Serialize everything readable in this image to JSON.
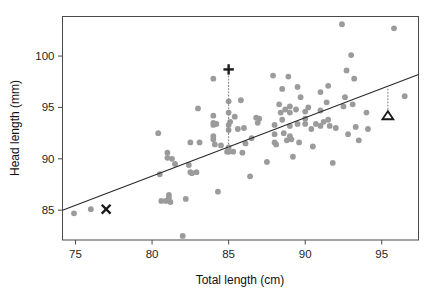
{
  "chart_data": {
    "type": "scatter",
    "title": "",
    "xlabel": "Total length (cm)",
    "ylabel": "Head length (mm)",
    "xlim": [
      74.15,
      97.4
    ],
    "ylim": [
      82.1,
      103.85
    ],
    "xticks": [
      75,
      80,
      85,
      90,
      95
    ],
    "yticks": [
      85,
      90,
      95,
      100
    ],
    "xtick_labels": [
      "75",
      "80",
      "85",
      "90",
      "95"
    ],
    "ytick_labels": [
      "85",
      "90",
      "95",
      "100"
    ],
    "grid": false,
    "legend": "none",
    "series": [
      {
        "name": "possum observations",
        "marker": "circle",
        "color": "#9b9b9b",
        "points": [
          [
            74.9,
            84.7
          ],
          [
            76.0,
            85.1
          ],
          [
            80.4,
            92.5
          ],
          [
            80.5,
            88.5
          ],
          [
            80.6,
            85.9
          ],
          [
            80.9,
            85.9
          ],
          [
            81.0,
            90.6
          ],
          [
            81.0,
            90.1
          ],
          [
            81.1,
            86.5
          ],
          [
            81.1,
            86.2
          ],
          [
            81.2,
            85.8
          ],
          [
            81.3,
            90.0
          ],
          [
            81.5,
            89.5
          ],
          [
            82.0,
            82.5
          ],
          [
            82.2,
            86.1
          ],
          [
            82.4,
            89.4
          ],
          [
            82.5,
            91.6
          ],
          [
            82.5,
            88.7
          ],
          [
            82.6,
            88.6
          ],
          [
            82.9,
            88.7
          ],
          [
            83.0,
            94.9
          ],
          [
            83.1,
            91.6
          ],
          [
            84.0,
            97.8
          ],
          [
            84.0,
            94.2
          ],
          [
            84.0,
            93.5
          ],
          [
            84.0,
            93.3
          ],
          [
            84.0,
            92.2
          ],
          [
            84.0,
            91.9
          ],
          [
            84.1,
            91.4
          ],
          [
            84.2,
            93.4
          ],
          [
            84.3,
            86.8
          ],
          [
            84.5,
            91.3
          ],
          [
            84.9,
            90.7
          ],
          [
            85.0,
            95.6
          ],
          [
            85.0,
            94.5
          ],
          [
            85.0,
            93.3
          ],
          [
            85.0,
            92.8
          ],
          [
            85.0,
            91.1
          ],
          [
            85.0,
            90.7
          ],
          [
            85.1,
            93.6
          ],
          [
            85.3,
            90.7
          ],
          [
            85.4,
            94.1
          ],
          [
            85.6,
            92.9
          ],
          [
            85.8,
            95.7
          ],
          [
            85.9,
            90.6
          ],
          [
            86.0,
            93.0
          ],
          [
            86.1,
            91.5
          ],
          [
            86.4,
            88.3
          ],
          [
            86.5,
            92.0
          ],
          [
            86.8,
            94.0
          ],
          [
            86.9,
            93.5
          ],
          [
            87.0,
            93.9
          ],
          [
            87.5,
            89.7
          ],
          [
            87.9,
            98.1
          ],
          [
            88.0,
            93.3
          ],
          [
            88.0,
            92.4
          ],
          [
            88.0,
            91.6
          ],
          [
            88.1,
            91.4
          ],
          [
            88.3,
            95.3
          ],
          [
            88.4,
            94.5
          ],
          [
            88.5,
            96.8
          ],
          [
            88.5,
            93.8
          ],
          [
            88.6,
            92.5
          ],
          [
            88.7,
            94.8
          ],
          [
            88.8,
            91.8
          ],
          [
            88.9,
            98.0
          ],
          [
            89.0,
            95.1
          ],
          [
            89.0,
            94.5
          ],
          [
            89.0,
            93.2
          ],
          [
            89.0,
            92.2
          ],
          [
            89.1,
            91.9
          ],
          [
            89.2,
            90.2
          ],
          [
            89.4,
            94.8
          ],
          [
            89.5,
            97.0
          ],
          [
            89.5,
            93.4
          ],
          [
            89.6,
            91.6
          ],
          [
            89.7,
            96.0
          ],
          [
            90.0,
            94.6
          ],
          [
            90.0,
            93.9
          ],
          [
            90.0,
            93.4
          ],
          [
            90.2,
            95.0
          ],
          [
            90.4,
            92.9
          ],
          [
            90.5,
            91.2
          ],
          [
            90.7,
            93.4
          ],
          [
            91.0,
            96.5
          ],
          [
            91.0,
            94.7
          ],
          [
            91.0,
            93.2
          ],
          [
            91.2,
            93.6
          ],
          [
            91.4,
            95.5
          ],
          [
            91.5,
            97.1
          ],
          [
            91.5,
            93.8
          ],
          [
            91.6,
            93.2
          ],
          [
            91.8,
            89.6
          ],
          [
            92.0,
            93.0
          ],
          [
            92.4,
            103.1
          ],
          [
            92.5,
            95.1
          ],
          [
            92.6,
            96.0
          ],
          [
            92.7,
            98.6
          ],
          [
            92.8,
            92.4
          ],
          [
            93.0,
            100.1
          ],
          [
            93.1,
            95.3
          ],
          [
            93.2,
            97.8
          ],
          [
            93.3,
            93.1
          ],
          [
            93.5,
            91.8
          ],
          [
            94.0,
            94.5
          ],
          [
            94.1,
            92.9
          ],
          [
            95.8,
            102.7
          ],
          [
            96.5,
            96.1
          ]
        ]
      }
    ],
    "fit_line": {
      "name": "least squares regression line",
      "color": "#2b2b2b",
      "x_start": 74.15,
      "y_start": 85.0,
      "x_end": 97.4,
      "y_end": 98.2
    },
    "annotations": [
      {
        "name": "cross-marker",
        "symbol": "x",
        "x": 77.0,
        "y": 85.1,
        "color": "#1a1a1a",
        "leader": null
      },
      {
        "name": "plus-marker",
        "symbol": "+",
        "x": 85.0,
        "y": 98.7,
        "color": "#1a1a1a",
        "leader": {
          "to_x": 85.0,
          "to_y": 91.1,
          "style": "dotted"
        }
      },
      {
        "name": "triangle-marker",
        "symbol": "triangle",
        "x": 95.4,
        "y": 94.2,
        "color": "#1a1a1a",
        "leader": {
          "to_x": 95.4,
          "to_y": 97.0,
          "style": "dotted"
        }
      }
    ]
  }
}
